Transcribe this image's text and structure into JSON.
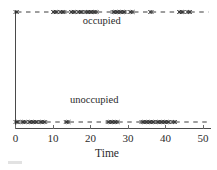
{
  "chart_data": {
    "type": "line",
    "title": "",
    "subtitle": "",
    "xlabel": "Time",
    "ylabel": "",
    "xlim": [
      0,
      52
    ],
    "ylim": [
      0,
      1
    ],
    "grid": false,
    "legend": null,
    "xticks": [
      0,
      10,
      20,
      30,
      40,
      50
    ],
    "xtick_labels": [
      "0",
      "10",
      "20",
      "30",
      "40",
      "50"
    ],
    "yticks": [],
    "ytick_labels": [],
    "annotations": [
      {
        "text": "occupied",
        "x": 23,
        "y": 0.87,
        "name": "occupied-label"
      },
      {
        "text": "unoccupied",
        "x": 21,
        "y": 0.21,
        "name": "unoccupied-label"
      }
    ],
    "series": [
      {
        "name": "occupied",
        "level": 1,
        "marker": "x",
        "linestyle": "dashed",
        "color": "#2b2b2b",
        "marker_runs": [
          [
            0.0,
            0.4
          ],
          [
            10.0,
            11.4
          ],
          [
            11.9,
            13.2
          ],
          [
            14.8,
            16.2
          ],
          [
            16.7,
            18.1
          ],
          [
            18.6,
            21.9
          ],
          [
            25.9,
            29.4
          ],
          [
            30.5,
            31.6
          ],
          [
            35.9,
            36.3
          ],
          [
            43.6,
            45.1
          ],
          [
            45.8,
            46.6
          ]
        ],
        "dash_runs": [
          [
            0.4,
            10.0
          ],
          [
            13.2,
            14.8
          ],
          [
            21.9,
            25.9
          ],
          [
            31.6,
            35.9
          ],
          [
            36.3,
            43.6
          ],
          [
            46.6,
            51.5
          ]
        ]
      },
      {
        "name": "unoccupied",
        "level": 0,
        "marker": "x",
        "linestyle": "dashed",
        "color": "#2b2b2b",
        "marker_runs": [
          [
            0.0,
            1.1
          ],
          [
            1.6,
            3.0
          ],
          [
            3.5,
            5.9
          ],
          [
            6.4,
            8.2
          ],
          [
            13.4,
            14.4
          ],
          [
            24.6,
            27.4
          ],
          [
            33.6,
            37.1
          ],
          [
            37.6,
            41.3
          ],
          [
            41.8,
            42.6
          ]
        ],
        "dash_runs": [
          [
            8.2,
            13.4
          ],
          [
            14.4,
            24.6
          ],
          [
            27.4,
            33.6
          ],
          [
            42.6,
            51.5
          ]
        ]
      }
    ]
  },
  "figure": {
    "alt": "Occupancy state versus time step plot",
    "background": "#ffffff",
    "axis_color": "#4a4a4a"
  }
}
